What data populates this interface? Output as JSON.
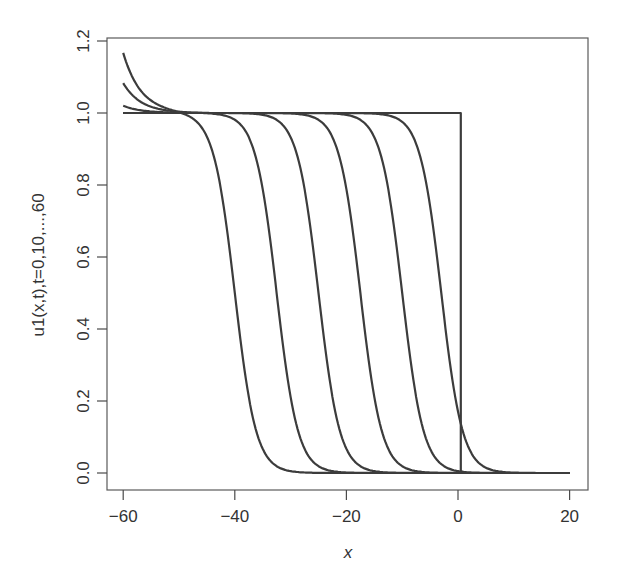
{
  "chart_data": {
    "type": "line",
    "title": "",
    "xlabel": "x",
    "ylabel": "u1(x,t),t=0,10,...,60",
    "xlim": [
      -63,
      23
    ],
    "ylim": [
      -0.05,
      1.22
    ],
    "x_ticks": [
      -60,
      -40,
      -20,
      0,
      20
    ],
    "x_tick_labels": [
      "−60",
      "−40",
      "−20",
      "0",
      "20"
    ],
    "y_ticks": [
      0.0,
      0.2,
      0.4,
      0.6,
      0.8,
      1.0,
      1.2
    ],
    "y_tick_labels": [
      "0.0",
      "0.2",
      "0.4",
      "0.6",
      "0.8",
      "1.0",
      "1.2"
    ],
    "grid": false,
    "legend": null,
    "series": [
      {
        "name": "t=0",
        "kind": "step",
        "front_x": 0.5,
        "left_value": 1.0,
        "right_value": 0.0,
        "left_boundary_value": 1.0
      },
      {
        "name": "t=10",
        "kind": "front",
        "front_x": -3,
        "width": 1.9,
        "left_boundary_value": 1.0
      },
      {
        "name": "t=20",
        "kind": "front",
        "front_x": -10,
        "width": 1.9,
        "left_boundary_value": 1.0
      },
      {
        "name": "t=30",
        "kind": "front",
        "front_x": -17.5,
        "width": 1.9,
        "left_boundary_value": 1.0
      },
      {
        "name": "t=40",
        "kind": "front",
        "front_x": -25,
        "width": 1.9,
        "left_boundary_value": 1.02
      },
      {
        "name": "t=50",
        "kind": "front",
        "front_x": -32.5,
        "width": 1.9,
        "left_boundary_value": 1.083
      },
      {
        "name": "t=60",
        "kind": "front",
        "front_x": -40,
        "width": 1.9,
        "left_boundary_value": 1.167
      }
    ],
    "x_range_of_curves": [
      -60,
      20
    ]
  },
  "labels": {
    "xlabel": "x",
    "ylabel": "u1(x,t),t=0,10,...,60"
  }
}
